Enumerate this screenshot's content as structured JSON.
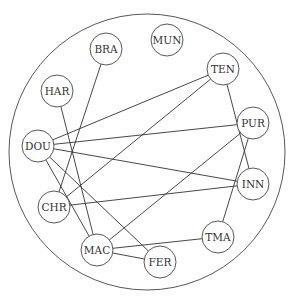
{
  "diagram": {
    "type": "network graph in circular boundary",
    "nodes": [
      {
        "id": "BRA",
        "label": "BRA",
        "x": 106,
        "y": 49
      },
      {
        "id": "MUN",
        "label": "MUN",
        "x": 167,
        "y": 40
      },
      {
        "id": "TEN",
        "label": "TEN",
        "x": 223,
        "y": 69
      },
      {
        "id": "HAR",
        "label": "HAR",
        "x": 57,
        "y": 91
      },
      {
        "id": "PUR",
        "label": "PUR",
        "x": 253,
        "y": 123
      },
      {
        "id": "DOU",
        "label": "DOU",
        "x": 38,
        "y": 146
      },
      {
        "id": "INN",
        "label": "INN",
        "x": 253,
        "y": 184
      },
      {
        "id": "CHR",
        "label": "CHR",
        "x": 54,
        "y": 207
      },
      {
        "id": "TMA",
        "label": "TMA",
        "x": 218,
        "y": 237
      },
      {
        "id": "MAC",
        "label": "MAC",
        "x": 97,
        "y": 250
      },
      {
        "id": "FER",
        "label": "FER",
        "x": 160,
        "y": 262
      }
    ],
    "edges": [
      [
        "BRA",
        "CHR"
      ],
      [
        "HAR",
        "MAC"
      ],
      [
        "DOU",
        "TEN"
      ],
      [
        "DOU",
        "PUR"
      ],
      [
        "DOU",
        "INN"
      ],
      [
        "DOU",
        "MAC"
      ],
      [
        "DOU",
        "FER"
      ],
      [
        "CHR",
        "TEN"
      ],
      [
        "CHR",
        "INN"
      ],
      [
        "MAC",
        "PUR"
      ],
      [
        "MAC",
        "TMA"
      ],
      [
        "MAC",
        "FER"
      ],
      [
        "TEN",
        "INN"
      ],
      [
        "PUR",
        "TMA"
      ]
    ],
    "boundary": {
      "cx": 147,
      "cy": 152,
      "r": 138
    },
    "node_radius": 16
  }
}
